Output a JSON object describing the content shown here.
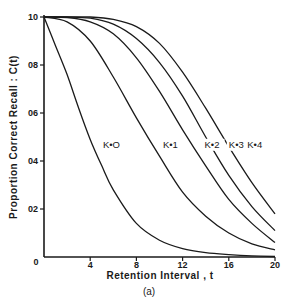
{
  "chart_data": {
    "type": "line",
    "title": "",
    "caption": "(a)",
    "xlabel": "Retention Interval , t",
    "ylabel": "Proportion Correct Recall : C(t)",
    "xlim": [
      0,
      20
    ],
    "ylim": [
      0,
      1.0
    ],
    "xticks": [
      0,
      4,
      8,
      12,
      16,
      20
    ],
    "xtick_labels": [
      "0",
      "4",
      "8",
      "12",
      "16",
      "20"
    ],
    "yticks": [
      0,
      0.2,
      0.4,
      0.6,
      0.8,
      1.0
    ],
    "ytick_labels": [
      "0",
      "02",
      "04",
      "06",
      "08",
      "10"
    ],
    "grid": false,
    "legend": "inline labels",
    "series": [
      {
        "name": "K=0",
        "label": "K•O",
        "x": [
          0,
          1,
          2,
          3,
          4,
          5,
          6,
          8,
          10,
          12,
          14,
          16,
          18,
          20
        ],
        "values": [
          1.0,
          0.88,
          0.76,
          0.62,
          0.49,
          0.38,
          0.28,
          0.14,
          0.07,
          0.035,
          0.018,
          0.01,
          0.005,
          0.002
        ]
      },
      {
        "name": "K=1",
        "label": "K•1",
        "x": [
          0,
          2,
          4,
          6,
          8,
          10,
          12,
          14,
          16,
          18,
          20
        ],
        "values": [
          1.0,
          0.98,
          0.9,
          0.75,
          0.58,
          0.42,
          0.27,
          0.17,
          0.1,
          0.055,
          0.03
        ]
      },
      {
        "name": "K=2",
        "label": "K•2",
        "x": [
          0,
          2,
          4,
          6,
          8,
          10,
          12,
          14,
          16,
          18,
          20
        ],
        "values": [
          1.0,
          0.998,
          0.98,
          0.93,
          0.83,
          0.69,
          0.53,
          0.38,
          0.24,
          0.14,
          0.06
        ]
      },
      {
        "name": "K=3",
        "label": "K•3",
        "x": [
          0,
          2,
          4,
          6,
          8,
          10,
          12,
          14,
          16,
          18,
          20
        ],
        "values": [
          1.0,
          1.0,
          0.995,
          0.97,
          0.91,
          0.81,
          0.67,
          0.5,
          0.34,
          0.21,
          0.11
        ]
      },
      {
        "name": "K=4",
        "label": "K•4",
        "x": [
          0,
          2,
          4,
          6,
          8,
          10,
          12,
          14,
          16,
          18,
          20
        ],
        "values": [
          1.0,
          1.0,
          1.0,
          0.99,
          0.96,
          0.89,
          0.77,
          0.62,
          0.46,
          0.31,
          0.18
        ]
      }
    ],
    "label_positions": [
      {
        "series": "K=0",
        "t": 5.1,
        "c": 0.455
      },
      {
        "series": "K=1",
        "t": 10.3,
        "c": 0.455
      },
      {
        "series": "K=2",
        "t": 13.9,
        "c": 0.455
      },
      {
        "series": "K=3",
        "t": 16.0,
        "c": 0.455
      },
      {
        "series": "K=4",
        "t": 17.6,
        "c": 0.455
      }
    ]
  }
}
